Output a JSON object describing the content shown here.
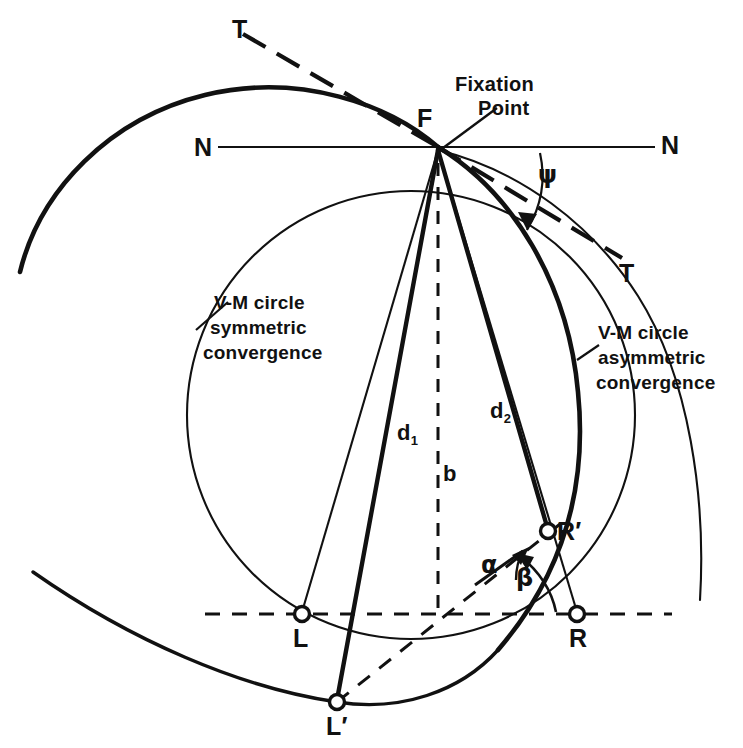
{
  "figure": {
    "type": "geometric-diagram",
    "background_color": "#ffffff",
    "ink_color": "#111111"
  },
  "labels": {
    "fixation_point": "Fixation\nPoint",
    "fixation_point_line1": "Fixation",
    "fixation_point_line2": "Point",
    "point_F": "F",
    "nasal_left": "N",
    "nasal_right": "N",
    "temporal_upper": "T",
    "temporal_lower": "T",
    "vm_symmetric_line1": "V-M circle",
    "vm_symmetric_line2": "symmetric",
    "vm_symmetric_line3": "convergence",
    "vm_asymmetric_line1": "V-M circle",
    "vm_asymmetric_line2": "asymmetric",
    "vm_asymmetric_line3": "convergence",
    "distance_d1": "d",
    "distance_d1_sub": "1",
    "distance_d2": "d",
    "distance_d2_sub": "2",
    "baseline_b": "b",
    "point_L": "L",
    "point_L_prime": "L′",
    "point_R": "R",
    "point_R_prime": "R′",
    "angle_alpha": "α",
    "angle_beta": "β",
    "angle_psi": "ψ"
  },
  "geometry": {
    "fixation_point": {
      "x": 438,
      "y": 147
    },
    "point_L": {
      "x": 302,
      "y": 614
    },
    "point_R": {
      "x": 577,
      "y": 614
    },
    "point_L_prime": {
      "x": 337,
      "y": 702
    },
    "point_R_prime": {
      "x": 548,
      "y": 532
    },
    "symmetric_circle": {
      "cx": 411,
      "cy": 415,
      "r": 224
    },
    "asymmetric_circle": {
      "cx": 270,
      "cy": 430,
      "r": 335
    },
    "nasal_axis": {
      "x1": 218,
      "y1": 147,
      "x2": 655,
      "y2": 147
    },
    "interocular_axis": {
      "x1": 205,
      "y1": 614,
      "x2": 672,
      "y2": 614
    },
    "midline_b": {
      "x1": 438,
      "y1": 160,
      "x2": 438,
      "y2": 614
    }
  },
  "colors": {
    "stroke": "#111111",
    "background": "#ffffff"
  }
}
